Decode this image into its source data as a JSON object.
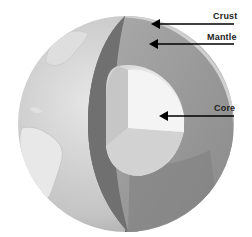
{
  "labels": [
    {
      "id": "crust",
      "text": "Crust"
    },
    {
      "id": "mantle",
      "text": "Mantle"
    },
    {
      "id": "core",
      "text": "Core"
    }
  ],
  "colors": {
    "ocean": "#c9c9c9",
    "land": "#e4e4e4",
    "mantle_dark": "#7a7a7a",
    "mantle_light": "#9a9a9a",
    "core_light": "#f2f2f2",
    "core_mid": "#d6d6d6",
    "arrow": "#000000"
  }
}
